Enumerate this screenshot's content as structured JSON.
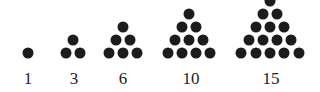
{
  "figure": {
    "dot_color": "#1c1c1c",
    "groups": [
      {
        "label": "1",
        "rows": 1,
        "cx": 28
      },
      {
        "label": "3",
        "rows": 2,
        "cx": 73
      },
      {
        "label": "6",
        "rows": 3,
        "cx": 123
      },
      {
        "label": "10",
        "rows": 4,
        "cx": 189
      },
      {
        "label": "15",
        "rows": 5,
        "cx": 270
      }
    ],
    "labels": [
      "1",
      "3",
      "6",
      "10",
      "15"
    ]
  }
}
